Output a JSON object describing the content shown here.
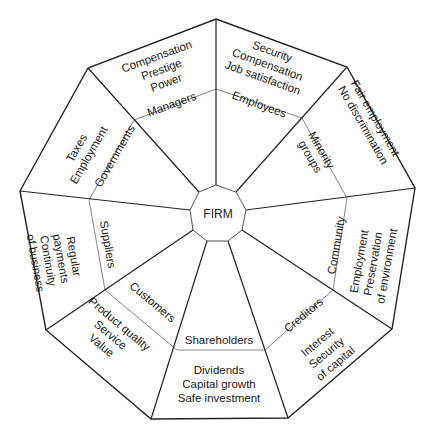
{
  "header": {
    "cut_off_text": "(partially cropped caption text at top edge)"
  },
  "center": {
    "label": "FIRM"
  },
  "segments": [
    {
      "stakeholder": "Managers",
      "interests": [
        "Compensation",
        "Prestige",
        "Power"
      ]
    },
    {
      "stakeholder": "Employees",
      "interests": [
        "Security",
        "Compensation",
        "Job satisfaction"
      ]
    },
    {
      "stakeholder": "Minority groups",
      "stakeholder_lines": [
        "Minority",
        "groups"
      ],
      "interests": [
        "Fair employment",
        "No discrimination"
      ]
    },
    {
      "stakeholder": "Community",
      "interests": [
        "Employment",
        "Preservation",
        "of environment"
      ]
    },
    {
      "stakeholder": "Creditors",
      "interests": [
        "Interest",
        "Security",
        "of capital"
      ]
    },
    {
      "stakeholder": "Shareholders",
      "interests": [
        "Dividends",
        "Capital growth",
        "Safe investment"
      ]
    },
    {
      "stakeholder": "Customers",
      "interests": [
        "Product quality",
        "Service",
        "Value"
      ]
    },
    {
      "stakeholder": "Suppliers",
      "interests": [
        "Regular",
        "payments",
        "Continuity",
        "of business"
      ]
    },
    {
      "stakeholder": "Governments",
      "interests": [
        "Taxes",
        "Employment"
      ]
    }
  ]
}
